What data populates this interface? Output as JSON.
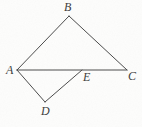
{
  "figure": {
    "type": "geometry-diagram",
    "width": 142,
    "height": 127,
    "background_color": "#fdfdfc",
    "stroke_color": "#4a4a4a",
    "stroke_width": 1,
    "label_color": "#3b3b3b",
    "points": [
      {
        "id": "A",
        "label": "A",
        "x": 17,
        "y": 70,
        "label_x": 6,
        "label_y": 64
      },
      {
        "id": "B",
        "label": "B",
        "x": 69,
        "y": 16,
        "label_x": 64,
        "label_y": 1
      },
      {
        "id": "C",
        "label": "C",
        "x": 127,
        "y": 70,
        "label_x": 128,
        "label_y": 70
      },
      {
        "id": "D",
        "label": "D",
        "x": 45,
        "y": 102,
        "label_x": 41,
        "label_y": 105
      },
      {
        "id": "E",
        "label": "E",
        "x": 82,
        "y": 70,
        "label_x": 83,
        "label_y": 71
      }
    ],
    "segments": [
      {
        "id": "AB",
        "from": "A",
        "to": "B",
        "x1": 17,
        "y1": 70,
        "x2": 69,
        "y2": 16
      },
      {
        "id": "BC",
        "from": "B",
        "to": "C",
        "x1": 69,
        "y1": 16,
        "x2": 127,
        "y2": 70
      },
      {
        "id": "AC",
        "from": "A",
        "to": "C",
        "x1": 17,
        "y1": 70,
        "x2": 127,
        "y2": 70
      },
      {
        "id": "AD",
        "from": "A",
        "to": "D",
        "x1": 17,
        "y1": 70,
        "x2": 45,
        "y2": 102
      },
      {
        "id": "DE",
        "from": "D",
        "to": "E",
        "x1": 45,
        "y1": 102,
        "x2": 82,
        "y2": 70
      }
    ]
  }
}
